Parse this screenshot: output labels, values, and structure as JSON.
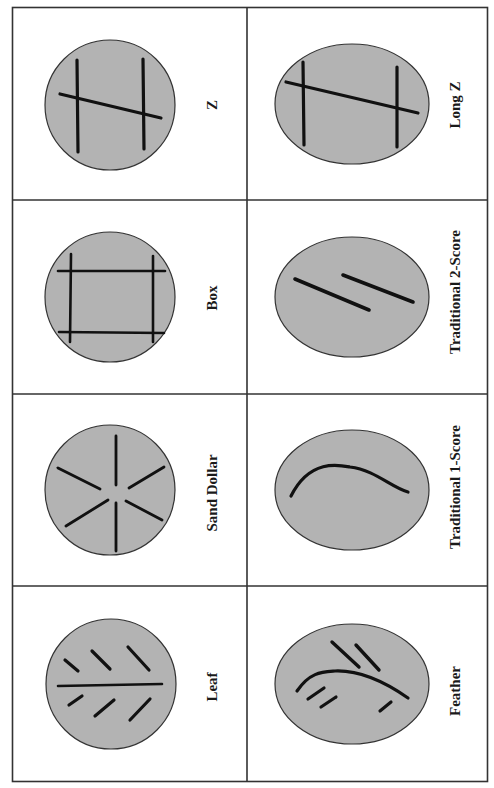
{
  "colors": {
    "background": "#ffffff",
    "grid_line": "#333333",
    "ellipse_fill": "#b3b3b3",
    "ellipse_stroke": "#333333",
    "score_mark": "#111111"
  },
  "grid": {
    "columns": 2,
    "rows": 4,
    "orientation": "rotated -90deg (labels read bottom-to-top)"
  },
  "cells": [
    {
      "row": 0,
      "col": 0,
      "label": "Z",
      "shape": "circle",
      "pattern": "two parallel vertical cuts joined by a diagonal"
    },
    {
      "row": 0,
      "col": 1,
      "label": "Long Z",
      "shape": "oval",
      "pattern": "two parallel vertical cuts joined by a long diagonal"
    },
    {
      "row": 1,
      "col": 0,
      "label": "Box",
      "shape": "circle",
      "pattern": "four cuts forming a square"
    },
    {
      "row": 1,
      "col": 1,
      "label": "Traditional 2-Score",
      "shape": "oval",
      "pattern": "two parallel diagonal cuts"
    },
    {
      "row": 2,
      "col": 0,
      "label": "Sand Dollar",
      "shape": "circle",
      "pattern": "six radial cuts"
    },
    {
      "row": 2,
      "col": 1,
      "label": "Traditional 1-Score",
      "shape": "oval",
      "pattern": "single curved cut"
    },
    {
      "row": 3,
      "col": 0,
      "label": "Leaf",
      "shape": "circle",
      "pattern": "central line with six angled side cuts"
    },
    {
      "row": 3,
      "col": 1,
      "label": "Feather",
      "shape": "oval",
      "pattern": "curved spine with short angled cuts"
    }
  ]
}
